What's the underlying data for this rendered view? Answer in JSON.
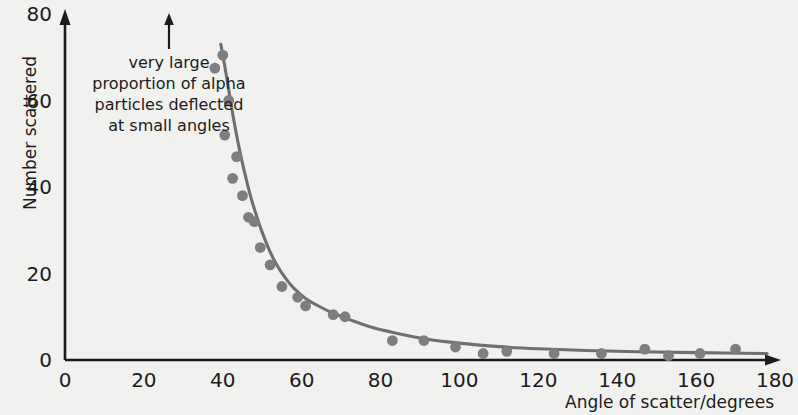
{
  "chart_data": {
    "type": "scatter",
    "title": "",
    "xlabel": "Angle of scatter/degrees",
    "ylabel": "Number scattered",
    "xlim": [
      0,
      180
    ],
    "ylim": [
      0,
      80
    ],
    "grid": false,
    "legend": null,
    "x_ticks": [
      "0",
      "20",
      "40",
      "60",
      "80",
      "100",
      "120",
      "140",
      "160",
      "180"
    ],
    "x_tick_values": [
      0,
      20,
      40,
      60,
      80,
      100,
      120,
      140,
      160,
      180
    ],
    "y_ticks": [
      "0",
      "20",
      "40",
      "60",
      "80"
    ],
    "y_tick_values": [
      0,
      20,
      40,
      60,
      80
    ],
    "series": [
      {
        "name": "alpha particles scattered",
        "marker_color": "#7e7e7e",
        "line_color": "#6f6f6f",
        "x": [
          38,
          40,
          40.5,
          41.5,
          42.5,
          43.5,
          45,
          46.5,
          48,
          49.5,
          52,
          55,
          59,
          61,
          68,
          71,
          83,
          91,
          99,
          106,
          112,
          124,
          136,
          147,
          153,
          161,
          170
        ],
        "y": [
          67.5,
          70.5,
          52,
          60,
          42,
          47,
          38,
          33,
          32,
          26,
          22,
          17,
          14.5,
          12.5,
          10.5,
          10,
          4.5,
          4.5,
          3,
          1.5,
          2,
          1.5,
          1.5,
          2.5,
          1,
          1.5,
          2.5
        ]
      }
    ],
    "fit_curve": {
      "name": "smoothed trend line",
      "color": "#6f6f6f",
      "x": [
        39.5,
        40.5,
        41.5,
        42.5,
        43.5,
        44.5,
        45.5,
        47,
        48.5,
        50,
        52,
        54,
        56,
        58,
        61,
        64,
        68,
        72,
        78,
        84,
        92,
        100,
        110,
        120,
        132,
        145,
        160,
        178
      ],
      "y": [
        73,
        68,
        62.5,
        57,
        52,
        47.5,
        43.5,
        38,
        33.5,
        29.5,
        25,
        21.5,
        18.8,
        16.6,
        14.2,
        12.6,
        10.8,
        9.4,
        7.5,
        6.2,
        4.8,
        3.9,
        3.1,
        2.6,
        2.2,
        1.9,
        1.7,
        1.5
      ]
    },
    "annotation": {
      "lines": [
        "very large",
        "proportion of alpha",
        "particles deflected",
        "at small angles"
      ],
      "arrow": "up-arrow pointing to small-angle region"
    }
  },
  "style": {
    "background_color": "#f1f1ef",
    "axis_color": "#1b1b1b",
    "data_color": "#7e7e7e",
    "text_color": "#1b1b1b"
  }
}
